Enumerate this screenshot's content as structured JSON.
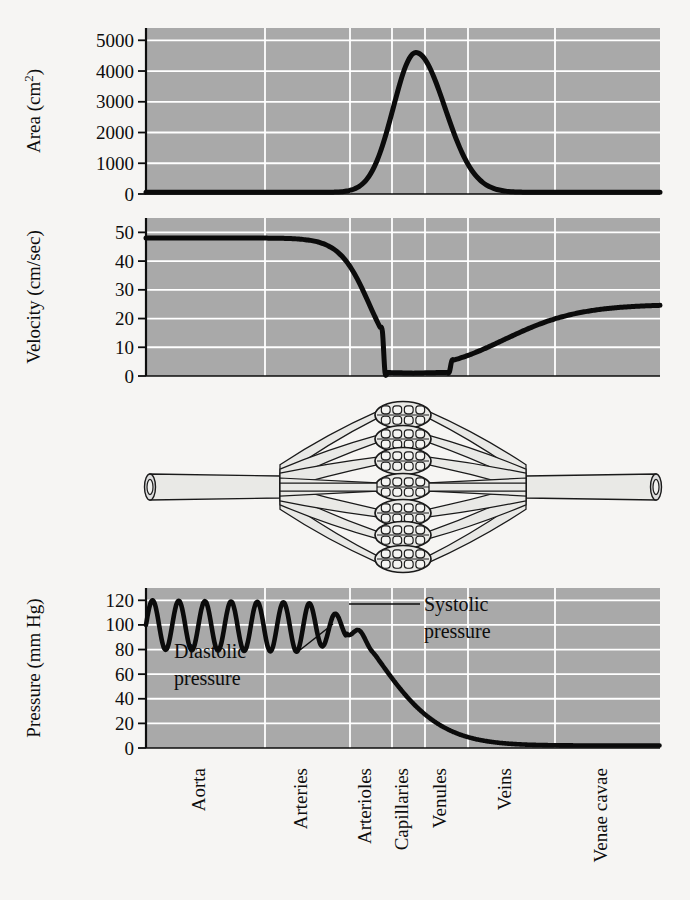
{
  "figure": {
    "background_color": "#f6f5f3",
    "panel_color": "#a9a9a9",
    "gridline_color": "#ffffff",
    "curve_color": "#0b0b0b"
  },
  "panels": {
    "area": {
      "axis_title": "Area (cm",
      "axis_title_sup": "2",
      "axis_title_close": ")",
      "ticks": [
        "5000",
        "4000",
        "3000",
        "2000",
        "1000",
        "0"
      ]
    },
    "velocity": {
      "axis_title": "Velocity (cm/sec)",
      "ticks": [
        "50",
        "40",
        "30",
        "20",
        "10",
        "0"
      ]
    },
    "pressure": {
      "axis_title": "Pressure (mm Hg)",
      "ticks": [
        "120",
        "100",
        "80",
        "60",
        "40",
        "20",
        "0"
      ],
      "annotations": [
        {
          "name": "systolic",
          "line1": "Systolic",
          "line2": "pressure"
        },
        {
          "name": "diastolic",
          "line1": "Diastolic",
          "line2": "pressure"
        }
      ]
    },
    "vessel_diagram": {
      "name": "blood-vessel-diagram",
      "description": "aorta-to-venae-cavae vessel branching with capillary beds",
      "capillary_bundle_count": 7
    }
  },
  "categories": [
    "Aorta",
    "Arteries",
    "Arterioles",
    "Capillaries",
    "Venules",
    "Veins",
    "Venae cavae"
  ],
  "chart_data": [
    {
      "type": "line",
      "name": "cross-sectional-area",
      "title": "",
      "xlabel": "",
      "ylabel": "Area (cm2)",
      "ylim": [
        0,
        5400
      ],
      "yticks": [
        0,
        1000,
        2000,
        3000,
        4000,
        5000
      ],
      "grid": true,
      "categories": [
        "Aorta",
        "Arteries",
        "Arterioles",
        "Capillaries",
        "Venules",
        "Veins",
        "Venae cavae"
      ],
      "values": [
        50,
        60,
        400,
        4600,
        800,
        120,
        60
      ],
      "x": [
        0,
        2.6,
        4.2,
        5.2,
        6.3,
        8.0,
        10
      ],
      "y": [
        40,
        60,
        1500,
        4600,
        1200,
        150,
        60
      ]
    },
    {
      "type": "line",
      "name": "blood-velocity",
      "title": "",
      "xlabel": "",
      "ylabel": "Velocity (cm/sec)",
      "ylim": [
        0,
        55
      ],
      "yticks": [
        0,
        10,
        20,
        30,
        40,
        50
      ],
      "grid": true,
      "categories": [
        "Aorta",
        "Arteries",
        "Arterioles",
        "Capillaries",
        "Venules",
        "Veins",
        "Venae cavae"
      ],
      "values": [
        48,
        47,
        20,
        1,
        3,
        18,
        25
      ],
      "x": [
        0,
        2.6,
        4.0,
        5.0,
        6.3,
        8.0,
        10
      ],
      "y": [
        48,
        45,
        18,
        1,
        4,
        22,
        25
      ]
    },
    {
      "type": "line",
      "name": "blood-pressure",
      "title": "",
      "xlabel": "",
      "ylabel": "Pressure (mm Hg)",
      "ylim": [
        0,
        130
      ],
      "yticks": [
        0,
        20,
        40,
        60,
        80,
        100,
        120
      ],
      "grid": true,
      "categories": [
        "Aorta",
        "Arteries",
        "Arterioles",
        "Capillaries",
        "Venules",
        "Veins",
        "Venae cavae"
      ],
      "systolic": 120,
      "diastolic": 80,
      "values": [
        100,
        100,
        70,
        22,
        12,
        7,
        2
      ],
      "x": [
        0,
        2.6,
        4.2,
        5.2,
        6.3,
        8.0,
        10
      ],
      "y": [
        100,
        100,
        60,
        22,
        12,
        6,
        2
      ],
      "pulsatile_until_x": 4.45,
      "annotations": [
        "Systolic pressure",
        "Diastolic pressure"
      ]
    }
  ]
}
